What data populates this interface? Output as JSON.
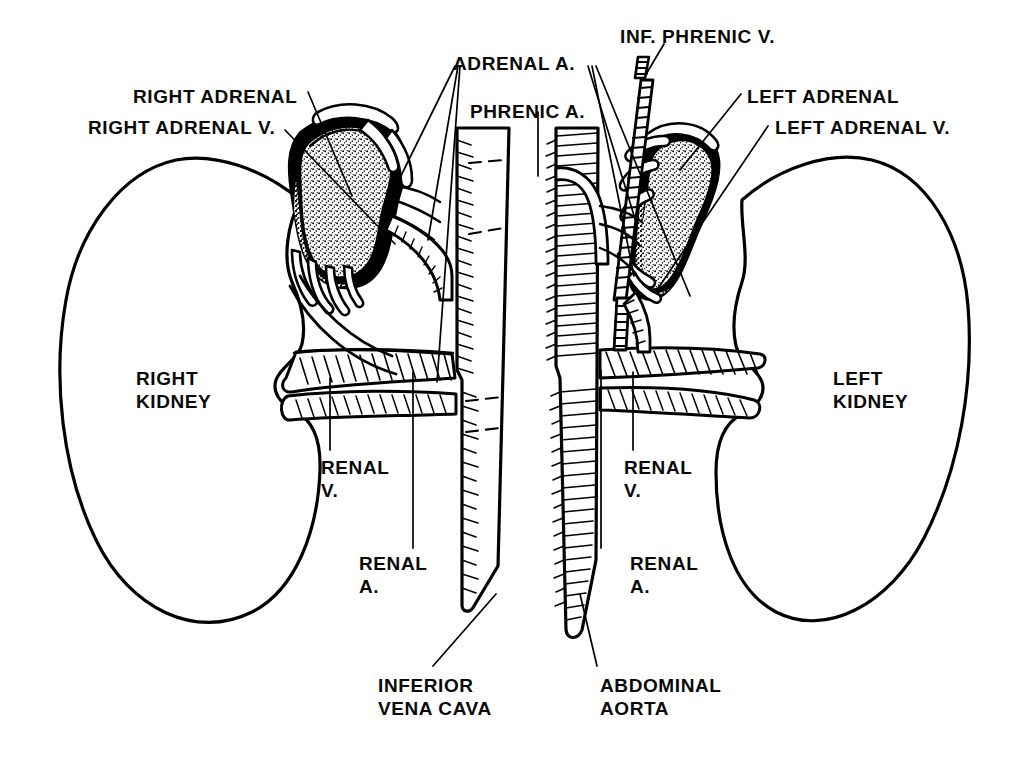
{
  "figure": {
    "kind": "anatomical-line-drawing",
    "style": "black-and-white pen-and-ink, stippled adrenal glands, hatched vessels",
    "background_color": "#ffffff",
    "ink_color": "#000000"
  },
  "labels": {
    "right_adrenal": {
      "text": "RIGHT ADRENAL",
      "x": 133,
      "y": 85,
      "align": "left"
    },
    "right_adrenal_v": {
      "text": "RIGHT ADRENAL V.",
      "x": 88,
      "y": 116,
      "align": "left"
    },
    "adrenal_a": {
      "text": "ADRENAL A.",
      "x": 453,
      "y": 52,
      "align": "left"
    },
    "phrenic_a": {
      "text": "PHRENIC A.",
      "x": 470,
      "y": 100,
      "align": "left"
    },
    "inf_phrenic_v": {
      "text": "INF. PHRENIC V.",
      "x": 620,
      "y": 25,
      "align": "left"
    },
    "left_adrenal": {
      "text": "LEFT ADRENAL",
      "x": 747,
      "y": 85,
      "align": "left"
    },
    "left_adrenal_v": {
      "text": "LEFT ADRENAL V.",
      "x": 775,
      "y": 116,
      "align": "left"
    },
    "right_kidney": {
      "text": "RIGHT\nKIDNEY",
      "x": 136,
      "y": 367,
      "align": "left"
    },
    "left_kidney": {
      "text": "LEFT\nKIDNEY",
      "x": 833,
      "y": 367,
      "align": "left"
    },
    "renal_v_right": {
      "text": "RENAL\nV.",
      "x": 321,
      "y": 456,
      "align": "left"
    },
    "renal_a_right": {
      "text": "RENAL\nA.",
      "x": 359,
      "y": 552,
      "align": "left"
    },
    "renal_v_left": {
      "text": "RENAL\nV.",
      "x": 624,
      "y": 456,
      "align": "left"
    },
    "renal_a_left": {
      "text": "RENAL\nA.",
      "x": 630,
      "y": 552,
      "align": "left"
    },
    "inferior_vena_cava": {
      "text": "INFERIOR\nVENA CAVA",
      "x": 378,
      "y": 674,
      "align": "left"
    },
    "abdominal_aorta": {
      "text": "ABDOMINAL\nAORTA",
      "x": 600,
      "y": 674,
      "align": "left"
    }
  },
  "structures": [
    {
      "name": "right-kidney",
      "side": "right",
      "type": "organ"
    },
    {
      "name": "left-kidney",
      "side": "left",
      "type": "organ"
    },
    {
      "name": "right-adrenal-gland",
      "side": "right",
      "type": "gland"
    },
    {
      "name": "left-adrenal-gland",
      "side": "left",
      "type": "gland"
    },
    {
      "name": "inferior-vena-cava",
      "side": "center",
      "type": "vein"
    },
    {
      "name": "abdominal-aorta",
      "side": "center",
      "type": "artery"
    },
    {
      "name": "right-renal-vein",
      "side": "right",
      "type": "vein"
    },
    {
      "name": "left-renal-vein",
      "side": "left",
      "type": "vein"
    },
    {
      "name": "right-renal-artery",
      "side": "right",
      "type": "artery"
    },
    {
      "name": "left-renal-artery",
      "side": "left",
      "type": "artery"
    },
    {
      "name": "right-adrenal-vein",
      "side": "right",
      "type": "vein"
    },
    {
      "name": "left-adrenal-vein",
      "side": "left",
      "type": "vein"
    },
    {
      "name": "inferior-phrenic-vein",
      "side": "left",
      "type": "vein"
    },
    {
      "name": "phrenic-artery",
      "side": "center",
      "type": "artery"
    },
    {
      "name": "adrenal-arteries",
      "side": "both",
      "type": "artery"
    }
  ]
}
